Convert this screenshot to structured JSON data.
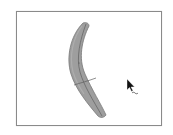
{
  "viewport": {
    "label": "3D viewport",
    "border_color": "#8a8a8a",
    "background": "#ffffff"
  },
  "model": {
    "shape": "curved-banana-mesh",
    "fill_color": "#9e9e9e",
    "edge_color": "#6f6f6f",
    "seam_color": "#5a5a5a"
  },
  "cursor": {
    "icon": "arrow-pointer-icon",
    "modifier": "tilde",
    "color": "#111111"
  }
}
